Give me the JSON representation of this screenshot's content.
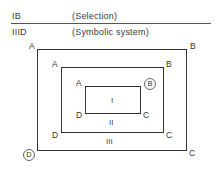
{
  "header": {
    "rows": [
      {
        "code": "IB",
        "label": "(Selection)"
      },
      {
        "code": "IIID",
        "label": "(Symbolic system)"
      }
    ]
  },
  "diagram": {
    "outer": {
      "corners": {
        "tl": "A",
        "tr": "B",
        "br": "C",
        "bl": "D"
      },
      "circled": "D",
      "region": "III"
    },
    "middle": {
      "corners": {
        "tl": "A",
        "tr": "B",
        "br": "C",
        "bl": "D"
      },
      "region": "II"
    },
    "inner": {
      "corners": {
        "tl": "A",
        "tr": "B",
        "br": "C",
        "bl": "D"
      },
      "circled": "B",
      "region": "I"
    }
  }
}
